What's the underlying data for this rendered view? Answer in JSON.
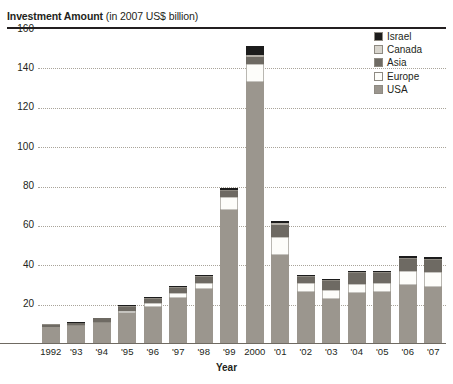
{
  "title": {
    "strong": "Investment Amount",
    "light": "(in 2007 US$ billion)"
  },
  "axes": {
    "xlabel": "Year",
    "ylabel": "",
    "ytick_labels": [
      "160",
      "140",
      "120",
      "100",
      "80",
      "60",
      "40",
      "20"
    ]
  },
  "legend": {
    "position": "top-right",
    "entries": [
      {
        "label": "Israel",
        "color": "#1c1c1c"
      },
      {
        "label": "Canada",
        "color": "#d8d5cd"
      },
      {
        "label": "Asia",
        "color": "#6e6a63"
      },
      {
        "label": "Europe",
        "color": "#fdfdfa"
      },
      {
        "label": "USA",
        "color": "#9b968e"
      }
    ]
  },
  "chart_data": {
    "type": "bar",
    "subtype": "stacked-bar",
    "title": "Investment Amount (in 2007 US$ billion)",
    "xlabel": "Year",
    "ylabel": "Investment Amount (in 2007 US$ billion)",
    "ylim": [
      0,
      160
    ],
    "ytick_interval": 20,
    "yticks": [
      20,
      40,
      60,
      80,
      100,
      120,
      140,
      160
    ],
    "grid": true,
    "categories": [
      "1992",
      "'93",
      "'94",
      "'95",
      "'96",
      "'97",
      "'98",
      "'99",
      "2000",
      "'01",
      "'02",
      "'03",
      "'04",
      "'05",
      "'06",
      "'07"
    ],
    "category_full": [
      "1992",
      "1993",
      "1994",
      "1995",
      "1996",
      "1997",
      "1998",
      "1999",
      "2000",
      "2001",
      "2002",
      "2003",
      "2004",
      "2005",
      "2006",
      "2007"
    ],
    "series": [
      {
        "name": "USA",
        "color": "#9b968e",
        "values": [
          8.5,
          9.0,
          10.5,
          15.5,
          19.0,
          23.5,
          28.0,
          68.0,
          133.0,
          45.0,
          26.5,
          23.0,
          26.0,
          26.5,
          30.0,
          29.0
        ]
      },
      {
        "name": "Europe",
        "color": "#fdfdfa",
        "values": [
          0.4,
          0.5,
          0.7,
          1.2,
          1.8,
          2.5,
          3.0,
          6.5,
          9.0,
          9.5,
          4.5,
          4.5,
          4.5,
          4.5,
          7.0,
          7.5
        ]
      },
      {
        "name": "Asia",
        "color": "#6e6a63",
        "values": [
          1.0,
          1.2,
          1.8,
          2.3,
          2.2,
          2.5,
          3.0,
          3.0,
          4.0,
          6.0,
          3.0,
          4.5,
          5.5,
          5.0,
          6.0,
          6.0
        ]
      },
      {
        "name": "Canada",
        "color": "#d8d5cd",
        "values": [
          0.2,
          0.2,
          0.2,
          0.3,
          0.4,
          0.5,
          0.6,
          0.8,
          1.0,
          1.0,
          0.6,
          0.6,
          0.6,
          0.6,
          0.7,
          0.7
        ]
      },
      {
        "name": "Israel",
        "color": "#1c1c1c",
        "values": [
          0.1,
          0.1,
          0.2,
          0.3,
          0.4,
          0.6,
          0.7,
          1.2,
          4.5,
          1.0,
          0.6,
          0.6,
          0.6,
          0.6,
          0.8,
          0.8
        ]
      }
    ],
    "totals": [
      10.2,
      11.0,
      13.4,
      19.6,
      23.8,
      29.6,
      35.3,
      79.5,
      151.5,
      62.5,
      35.2,
      33.2,
      37.2,
      37.2,
      44.5,
      44.0
    ]
  }
}
